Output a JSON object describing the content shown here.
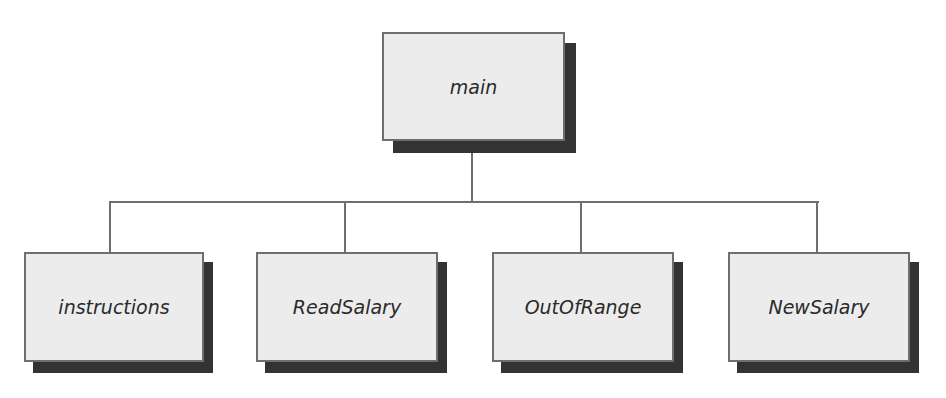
{
  "diagram": {
    "type": "structure-chart",
    "colors": {
      "node_fill": "#ececec",
      "node_border": "#6e6e6e",
      "shadow": "#333333",
      "connector": "#6e6e6e",
      "text": "#2a2a2a"
    },
    "root": {
      "label": "main"
    },
    "children": [
      {
        "label": "instructions"
      },
      {
        "label": "ReadSalary"
      },
      {
        "label": "OutOfRange"
      },
      {
        "label": "NewSalary"
      }
    ]
  }
}
